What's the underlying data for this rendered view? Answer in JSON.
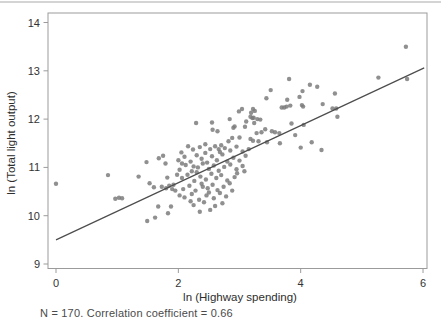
{
  "caption": "N = 170. Correlation coefficient = 0.66",
  "chart_data": {
    "type": "scatter",
    "title": "",
    "xlabel": "ln (Highway spending)",
    "ylabel": "ln (Total light output)",
    "xlim": [
      -0.131,
      6.065
    ],
    "ylim": [
      8.907,
      14.197
    ],
    "x_ticks": [
      0,
      2,
      4,
      6
    ],
    "y_ticks": [
      9,
      10,
      11,
      12,
      13,
      14
    ],
    "grid": false,
    "legend": "none",
    "point_color": "#7d7d7d",
    "point_opacity": 0.85,
    "point_radius": 2.2,
    "trend_color": "#4d4d4d",
    "axis_color": "#9b9b9b",
    "tick_label_color": "#333333",
    "trend_line": {
      "x1": 0.0,
      "y1": 9.5,
      "x2": 6.02,
      "y2": 13.06
    },
    "points": [
      [
        0.0,
        10.66
      ],
      [
        0.85,
        10.84
      ],
      [
        0.97,
        10.35
      ],
      [
        1.03,
        10.37
      ],
      [
        1.08,
        10.36
      ],
      [
        1.35,
        10.81
      ],
      [
        1.48,
        11.11
      ],
      [
        1.49,
        9.89
      ],
      [
        1.53,
        10.67
      ],
      [
        1.6,
        10.59
      ],
      [
        1.62,
        9.96
      ],
      [
        1.67,
        10.19
      ],
      [
        1.68,
        11.19
      ],
      [
        1.73,
        10.6
      ],
      [
        1.75,
        11.24
      ],
      [
        1.79,
        11.08
      ],
      [
        1.8,
        10.57
      ],
      [
        1.82,
        10.79
      ],
      [
        1.83,
        10.05
      ],
      [
        1.85,
        10.62
      ],
      [
        1.88,
        10.19
      ],
      [
        1.9,
        10.55
      ],
      [
        1.92,
        10.64
      ],
      [
        1.95,
        10.52
      ],
      [
        5.27,
        12.86
      ],
      [
        5.72,
        13.5
      ],
      [
        5.74,
        12.83
      ],
      [
        3.44,
        12.43
      ],
      [
        3.51,
        12.6
      ],
      [
        3.69,
        12.24
      ],
      [
        3.73,
        12.24
      ],
      [
        3.77,
        12.26
      ],
      [
        3.78,
        12.4
      ],
      [
        3.81,
        12.83
      ],
      [
        3.83,
        12.28
      ],
      [
        3.98,
        12.46
      ],
      [
        4.02,
        12.29
      ],
      [
        4.03,
        12.58
      ],
      [
        4.04,
        12.26
      ],
      [
        4.15,
        12.71
      ],
      [
        4.27,
        12.67
      ],
      [
        4.36,
        12.31
      ],
      [
        4.56,
        12.53
      ],
      [
        4.52,
        12.22
      ],
      [
        4.58,
        12.22
      ],
      [
        4.6,
        12.05
      ],
      [
        3.04,
        12.21
      ],
      [
        3.22,
        12.21
      ],
      [
        3.25,
        12.17
      ],
      [
        2.99,
        12.16
      ],
      [
        3.19,
        12.13
      ],
      [
        3.21,
        12.02
      ],
      [
        3.18,
        12.05
      ],
      [
        3.23,
        12.03
      ],
      [
        3.29,
        12.0
      ],
      [
        2.84,
        12.0
      ],
      [
        3.11,
        11.95
      ],
      [
        3.09,
        11.84
      ],
      [
        2.9,
        11.82
      ],
      [
        3.85,
        11.91
      ],
      [
        4.05,
        11.88
      ],
      [
        3.34,
        11.99
      ],
      [
        2.29,
        11.92
      ],
      [
        2.55,
        11.93
      ],
      [
        2.56,
        11.78
      ],
      [
        2.64,
        11.75
      ],
      [
        2.82,
        11.54
      ],
      [
        2.88,
        11.61
      ],
      [
        2.92,
        11.85
      ],
      [
        3.24,
        11.92
      ],
      [
        3.28,
        11.71
      ],
      [
        3.31,
        11.54
      ],
      [
        3.42,
        11.79
      ],
      [
        3.36,
        11.73
      ],
      [
        3.53,
        11.75
      ],
      [
        3.58,
        11.73
      ],
      [
        3.65,
        11.71
      ],
      [
        3.91,
        11.67
      ],
      [
        3.0,
        11.62
      ],
      [
        3.18,
        11.59
      ],
      [
        3.22,
        11.55
      ],
      [
        3.45,
        11.52
      ],
      [
        3.66,
        11.5
      ],
      [
        4.18,
        11.52
      ],
      [
        4.0,
        11.41
      ],
      [
        4.34,
        11.36
      ],
      [
        2.05,
        11.31
      ],
      [
        2.16,
        11.44
      ],
      [
        2.24,
        11.37
      ],
      [
        2.35,
        11.42
      ],
      [
        2.44,
        11.3
      ],
      [
        2.52,
        11.38
      ],
      [
        2.6,
        11.44
      ],
      [
        2.68,
        11.32
      ],
      [
        2.76,
        11.4
      ],
      [
        2.85,
        11.35
      ],
      [
        2.95,
        11.43
      ],
      [
        3.05,
        11.33
      ],
      [
        3.15,
        11.38
      ],
      [
        2.0,
        11.15
      ],
      [
        2.1,
        11.22
      ],
      [
        2.2,
        11.12
      ],
      [
        2.3,
        11.25
      ],
      [
        2.38,
        11.18
      ],
      [
        2.47,
        11.1
      ],
      [
        2.55,
        11.23
      ],
      [
        2.63,
        11.15
      ],
      [
        2.72,
        11.27
      ],
      [
        2.8,
        11.12
      ],
      [
        2.9,
        11.2
      ],
      [
        3.0,
        11.14
      ],
      [
        3.1,
        11.24
      ],
      [
        2.25,
        11.02
      ],
      [
        2.02,
        10.95
      ],
      [
        2.12,
        11.05
      ],
      [
        2.22,
        10.92
      ],
      [
        2.32,
        11.0
      ],
      [
        2.4,
        11.08
      ],
      [
        2.5,
        10.97
      ],
      [
        2.58,
        11.04
      ],
      [
        2.66,
        10.93
      ],
      [
        2.75,
        11.01
      ],
      [
        2.85,
        11.06
      ],
      [
        2.95,
        10.96
      ],
      [
        3.05,
        11.03
      ],
      [
        2.06,
        10.78
      ],
      [
        2.15,
        10.85
      ],
      [
        2.26,
        10.72
      ],
      [
        2.36,
        10.81
      ],
      [
        2.45,
        10.75
      ],
      [
        2.54,
        10.87
      ],
      [
        2.62,
        10.78
      ],
      [
        2.7,
        10.84
      ],
      [
        2.8,
        10.73
      ],
      [
        2.92,
        10.8
      ],
      [
        2.08,
        10.55
      ],
      [
        2.18,
        10.62
      ],
      [
        2.28,
        10.52
      ],
      [
        2.38,
        10.66
      ],
      [
        2.48,
        10.57
      ],
      [
        2.56,
        10.64
      ],
      [
        2.64,
        10.53
      ],
      [
        2.74,
        10.6
      ],
      [
        2.84,
        10.67
      ],
      [
        2.1,
        10.38
      ],
      [
        2.22,
        10.45
      ],
      [
        2.34,
        10.33
      ],
      [
        2.46,
        10.42
      ],
      [
        2.58,
        10.36
      ],
      [
        2.68,
        10.47
      ],
      [
        2.78,
        10.4
      ],
      [
        2.25,
        10.22
      ],
      [
        2.42,
        10.28
      ],
      [
        2.6,
        10.2
      ],
      [
        2.72,
        10.26
      ],
      [
        2.35,
        10.08
      ],
      [
        2.52,
        10.12
      ],
      [
        1.98,
        10.85
      ],
      [
        2.02,
        10.42
      ],
      [
        2.3,
        10.9
      ],
      [
        2.44,
        11.48
      ],
      [
        2.7,
        11.46
      ],
      [
        2.96,
        10.88
      ],
      [
        3.08,
        10.92
      ],
      [
        2.88,
        10.52
      ],
      [
        2.2,
        10.3
      ],
      [
        2.5,
        10.48
      ],
      [
        2.66,
        11.38
      ],
      [
        2.06,
        11.08
      ],
      [
        2.4,
        10.6
      ]
    ]
  }
}
